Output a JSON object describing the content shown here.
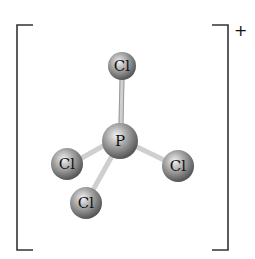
{
  "diagram": {
    "charge": "+",
    "central_atom": {
      "symbol": "P",
      "cx": 120,
      "cy": 141,
      "r": 18
    },
    "ligands": [
      {
        "symbol": "Cl",
        "cx": 122,
        "cy": 66,
        "r": 14,
        "position": "top"
      },
      {
        "symbol": "Cl",
        "cx": 67,
        "cy": 164,
        "r": 16,
        "position": "left"
      },
      {
        "symbol": "Cl",
        "cx": 178,
        "cy": 166,
        "r": 16,
        "position": "right"
      },
      {
        "symbol": "Cl",
        "cx": 86,
        "cy": 203,
        "r": 16,
        "position": "bottom-front"
      }
    ],
    "colors": {
      "atom_light": "#e6e6e6",
      "atom_dark": "#6f6f6f",
      "bond": "#c8c8c8",
      "bracket": "#333333"
    }
  }
}
